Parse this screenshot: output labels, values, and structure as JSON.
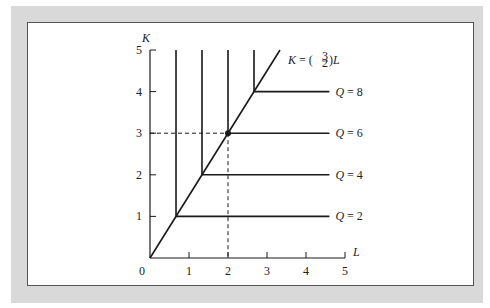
{
  "chart_data": {
    "type": "line",
    "title": "",
    "xlabel": "L",
    "ylabel": "K",
    "xlim": [
      0,
      5
    ],
    "ylim": [
      0,
      5
    ],
    "x_ticks": [
      "1",
      "2",
      "3",
      "4",
      "5"
    ],
    "y_ticks": [
      "1",
      "2",
      "3",
      "4",
      "5"
    ],
    "origin_label": "0",
    "grid": false,
    "expansion_path": {
      "label_prefix": "K = (",
      "label_num": "3",
      "label_den": "2",
      "label_suffix": ")L",
      "slope": 1.5,
      "points": [
        [
          0,
          0
        ],
        [
          3.333,
          5
        ]
      ]
    },
    "isoquants": [
      {
        "name": "Q = 2",
        "q_var": "Q",
        "eq": " = 2",
        "kink": [
          0.667,
          1
        ],
        "vertical_to_k": 5,
        "horizontal_to_l": 4.6
      },
      {
        "name": "Q = 4",
        "q_var": "Q",
        "eq": " = 4",
        "kink": [
          1.333,
          2
        ],
        "vertical_to_k": 5,
        "horizontal_to_l": 4.6
      },
      {
        "name": "Q = 6",
        "q_var": "Q",
        "eq": " = 6",
        "kink": [
          2,
          3
        ],
        "vertical_to_k": 5,
        "horizontal_to_l": 4.6
      },
      {
        "name": "Q = 8",
        "q_var": "Q",
        "eq": " = 8",
        "kink": [
          2.667,
          4
        ],
        "vertical_to_k": 5,
        "horizontal_to_l": 4.6
      }
    ],
    "highlight_point": {
      "L": 2,
      "K": 3,
      "dashed_guides": true
    }
  },
  "colors": {
    "frame_bg": "#d9d9d9",
    "plot_bg": "#ffffff",
    "line": "#1a1a1a"
  }
}
